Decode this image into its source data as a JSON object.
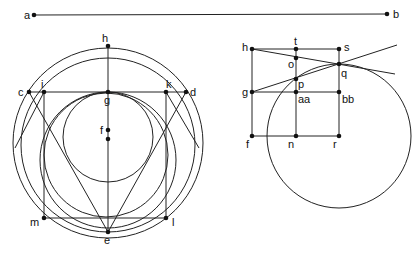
{
  "diagram": {
    "stroke_color": "#222222",
    "background": "#ffffff",
    "top_line": {
      "from": {
        "label": "a",
        "x": 34,
        "y": 15,
        "lx": 24,
        "ly": 19
      },
      "to": {
        "label": "b",
        "x": 387,
        "y": 14,
        "lx": 393,
        "ly": 18
      }
    },
    "left_figure": {
      "circles": [
        {
          "name": "outer-circle",
          "cx": 108,
          "cy": 143,
          "r": 95
        },
        {
          "name": "second-circle",
          "cx": 108,
          "cy": 145,
          "r": 87
        },
        {
          "name": "square-inscribed-circle",
          "cx": 106,
          "cy": 155,
          "r": 62
        },
        {
          "name": "medium-circle",
          "cx": 108,
          "cy": 160,
          "r": 68
        },
        {
          "name": "inner-circle",
          "cx": 108,
          "cy": 137,
          "r": 45
        }
      ],
      "points": [
        {
          "label": "h",
          "x": 108,
          "y": 46,
          "lx": 102,
          "ly": 42
        },
        {
          "label": "c",
          "x": 29,
          "y": 92,
          "lx": 18,
          "ly": 96
        },
        {
          "label": "i",
          "x": 44,
          "y": 92,
          "lx": 41,
          "ly": 88
        },
        {
          "label": "g",
          "x": 108,
          "y": 92,
          "lx": 104,
          "ly": 104
        },
        {
          "label": "k",
          "x": 166,
          "y": 92,
          "lx": 166,
          "ly": 88
        },
        {
          "label": "d",
          "x": 186,
          "y": 92,
          "lx": 190,
          "ly": 96
        },
        {
          "label": "f",
          "x": 108,
          "y": 130,
          "lx": 100,
          "ly": 134
        },
        {
          "label": "",
          "x": 108,
          "y": 139
        },
        {
          "label": "m",
          "x": 44,
          "y": 218,
          "lx": 30,
          "ly": 226
        },
        {
          "label": "l",
          "x": 166,
          "y": 218,
          "lx": 172,
          "ly": 226
        },
        {
          "label": "e",
          "x": 108,
          "y": 232,
          "lx": 104,
          "ly": 244
        }
      ],
      "segments": [
        [
          108,
          46,
          108,
          232
        ],
        [
          29,
          92,
          186,
          92
        ],
        [
          44,
          92,
          44,
          218
        ],
        [
          166,
          92,
          166,
          218
        ],
        [
          44,
          218,
          166,
          218
        ],
        [
          29,
          92,
          108,
          232
        ],
        [
          186,
          92,
          108,
          232
        ],
        [
          44,
          92,
          15,
          148
        ],
        [
          166,
          92,
          199,
          148
        ]
      ]
    },
    "right_figure": {
      "circles": [
        {
          "name": "large-circle",
          "cx": 339,
          "cy": 136,
          "r": 72
        }
      ],
      "points": [
        {
          "label": "h",
          "x": 252,
          "y": 49,
          "lx": 242,
          "ly": 51
        },
        {
          "label": "t",
          "x": 296,
          "y": 49,
          "lx": 294,
          "ly": 45
        },
        {
          "label": "s",
          "x": 339,
          "y": 49,
          "lx": 344,
          "ly": 51
        },
        {
          "label": "o",
          "x": 296,
          "y": 58,
          "lx": 288,
          "ly": 68
        },
        {
          "label": "q",
          "x": 339,
          "y": 64,
          "lx": 341,
          "ly": 77
        },
        {
          "label": "p",
          "x": 296,
          "y": 79,
          "lx": 298,
          "ly": 88
        },
        {
          "label": "g",
          "x": 252,
          "y": 92,
          "lx": 242,
          "ly": 96
        },
        {
          "label": "aa",
          "x": 296,
          "y": 92,
          "lx": 298,
          "ly": 103
        },
        {
          "label": "bb",
          "x": 339,
          "y": 92,
          "lx": 342,
          "ly": 103
        },
        {
          "label": "f",
          "x": 252,
          "y": 136,
          "lx": 246,
          "ly": 148
        },
        {
          "label": "n",
          "x": 296,
          "y": 136,
          "lx": 288,
          "ly": 148
        },
        {
          "label": "r",
          "x": 339,
          "y": 136,
          "lx": 333,
          "ly": 148
        }
      ],
      "segments": [
        [
          252,
          49,
          339,
          49
        ],
        [
          252,
          49,
          252,
          136
        ],
        [
          296,
          49,
          296,
          136
        ],
        [
          339,
          49,
          339,
          136
        ],
        [
          252,
          92,
          339,
          92
        ],
        [
          252,
          136,
          339,
          136
        ],
        [
          252,
          49,
          395,
          74
        ],
        [
          252,
          92,
          397,
          45
        ]
      ]
    }
  }
}
